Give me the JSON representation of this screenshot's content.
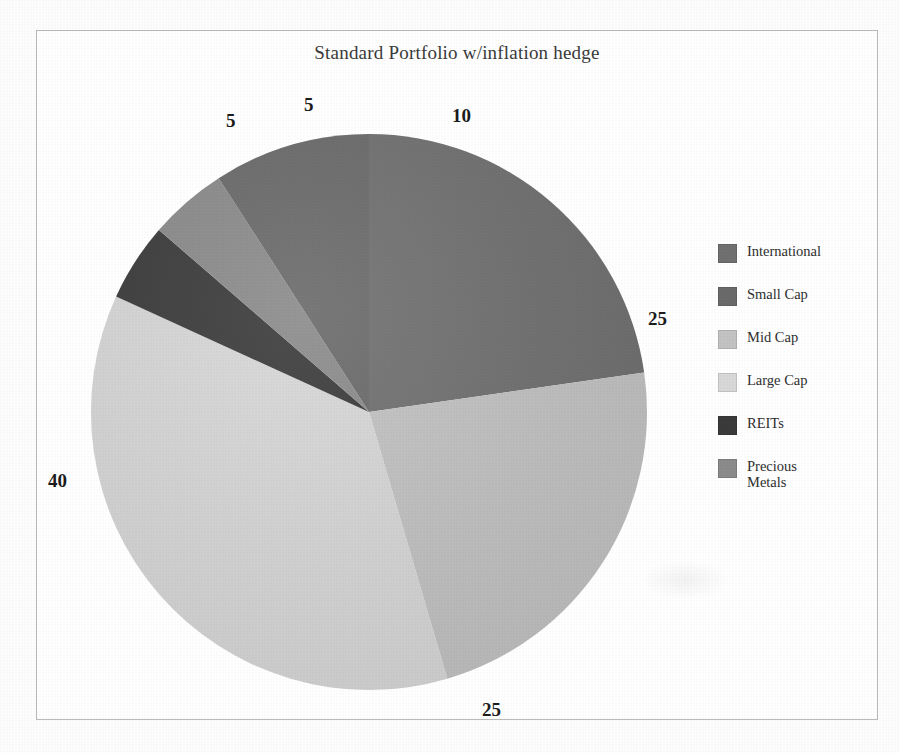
{
  "chart_data": {
    "type": "pie",
    "title": "Standard Portfolio w/inflation hedge",
    "categories": [
      "International",
      "Small Cap",
      "Mid Cap",
      "Large Cap",
      "REITs",
      "Precious Metals"
    ],
    "values": [
      25,
      10,
      25,
      40,
      5,
      5
    ],
    "total": 100,
    "units": "percent",
    "legend_position": "right",
    "grid": false,
    "start_angle_deg": 0,
    "direction": "clockwise",
    "slice_order_clockwise_from_top": [
      "International",
      "Mid Cap",
      "Large Cap",
      "REITs",
      "Precious Metals",
      "Small Cap"
    ],
    "colors": {
      "International": "#707070",
      "Small Cap": "#6a6a6a",
      "Mid Cap": "#c3c3c3",
      "Large Cap": "#d8d8d8",
      "REITs": "#3a3a3a",
      "Precious Metals": "#8b8b8b"
    },
    "data_labels": [
      {
        "text": "5",
        "category": "REITs"
      },
      {
        "text": "5",
        "category": "Precious Metals"
      },
      {
        "text": "10",
        "category": "Small Cap"
      },
      {
        "text": "25",
        "category": "International"
      },
      {
        "text": "25",
        "category": "Mid Cap"
      },
      {
        "text": "40",
        "category": "Large Cap"
      }
    ]
  },
  "legend": {
    "items": [
      {
        "label": "International",
        "color": "#707070"
      },
      {
        "label": "Small Cap",
        "color": "#6a6a6a"
      },
      {
        "label": "Mid Cap",
        "color": "#c3c3c3"
      },
      {
        "label": "Large Cap",
        "color": "#d8d8d8"
      },
      {
        "label": "REITs",
        "color": "#3a3a3a"
      },
      {
        "label": "Precious Metals",
        "color": "#8b8b8b"
      }
    ]
  },
  "labels": {
    "top_left_5": "5",
    "top_5": "5",
    "top_right_10": "10",
    "right_25": "25",
    "bottom_25": "25",
    "left_40": "40"
  }
}
